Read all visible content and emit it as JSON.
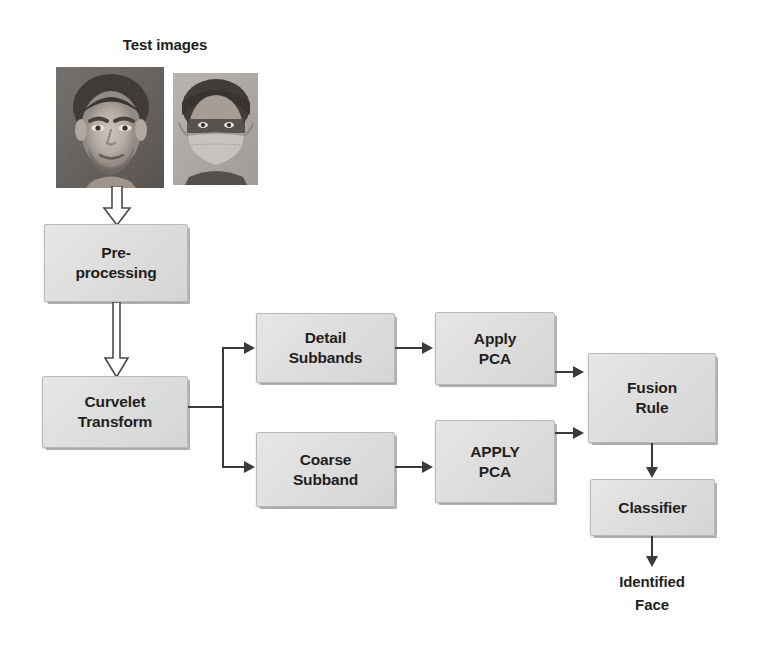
{
  "diagram": {
    "title": "Test images",
    "nodes": {
      "test_images_label": "Test images",
      "preprocessing": "Pre-\nprocessing",
      "curvelet_transform": "Curvelet\nTransform",
      "detail_subbands": "Detail\nSubbands",
      "coarse_subband": "Coarse\nSubband",
      "apply_pca_detail": "Apply\nPCA",
      "apply_pca_coarse": "APPLY\nPCA",
      "fusion_rule": "Fusion\nRule",
      "classifier": "Classifier",
      "identified_face": "Identified\nFace"
    },
    "images": [
      {
        "name": "unmasked-face-photo",
        "alt": "Unmasked male face, grayscale"
      },
      {
        "name": "masked-face-photo",
        "alt": "Face wearing a mask, grayscale"
      }
    ],
    "connectors": [
      {
        "from": "test_images",
        "to": "preprocessing",
        "style": "hollow-block-arrow",
        "direction": "down"
      },
      {
        "from": "preprocessing",
        "to": "curvelet_transform",
        "style": "hollow-block-arrow",
        "direction": "down"
      },
      {
        "from": "curvelet_transform",
        "to": "detail_subbands",
        "style": "solid-arrow",
        "direction": "right"
      },
      {
        "from": "curvelet_transform",
        "to": "coarse_subband",
        "style": "solid-arrow",
        "direction": "right"
      },
      {
        "from": "detail_subbands",
        "to": "apply_pca_detail",
        "style": "solid-arrow",
        "direction": "right"
      },
      {
        "from": "coarse_subband",
        "to": "apply_pca_coarse",
        "style": "solid-arrow",
        "direction": "right"
      },
      {
        "from": "apply_pca_detail",
        "to": "fusion_rule",
        "style": "solid-arrow",
        "direction": "right"
      },
      {
        "from": "apply_pca_coarse",
        "to": "fusion_rule",
        "style": "solid-arrow",
        "direction": "right"
      },
      {
        "from": "fusion_rule",
        "to": "classifier",
        "style": "solid-arrow",
        "direction": "down"
      },
      {
        "from": "classifier",
        "to": "identified_face",
        "style": "solid-arrow",
        "direction": "down"
      }
    ],
    "colors": {
      "box_fill": "#dedede",
      "box_border": "#b9b9b9",
      "text": "#231f20",
      "connector": "#3a3a3a",
      "background": "#ffffff"
    }
  }
}
